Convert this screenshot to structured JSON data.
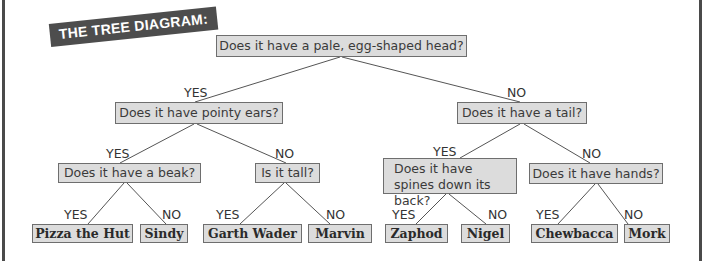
{
  "title": "THE TREE DIAGRAM:",
  "colors": {
    "box_fill": "#dcdcdc",
    "box_border": "#6e6e6e",
    "banner_bg": "#4d4d4d",
    "banner_text": "#ffffff",
    "line": "#555555",
    "frame": "#4a4a4a"
  },
  "tree": {
    "root": {
      "question": "Does it have a pale, egg-shaped head?",
      "yes_label": "YES",
      "no_label": "NO"
    },
    "level1": [
      {
        "question": "Does it have pointy ears?",
        "branch": "YES",
        "yes_label": "YES",
        "no_label": "NO"
      },
      {
        "question": "Does it have a tail?",
        "branch": "NO",
        "yes_label": "YES",
        "no_label": "NO"
      }
    ],
    "level2": [
      {
        "question": "Does it have a beak?",
        "branch": "YES",
        "yes_label": "YES",
        "no_label": "NO"
      },
      {
        "question": "Is it tall?",
        "branch": "NO",
        "yes_label": "YES",
        "no_label": "NO"
      },
      {
        "question": "Does it have spines down its back?",
        "branch": "YES",
        "yes_label": "YES",
        "no_label": "NO"
      },
      {
        "question": "Does it have hands?",
        "branch": "NO",
        "yes_label": "YES",
        "no_label": "NO"
      }
    ],
    "leaves": [
      {
        "name": "Pizza the Hut",
        "branch": "YES"
      },
      {
        "name": "Sindy",
        "branch": "NO"
      },
      {
        "name": "Garth Wader",
        "branch": "YES"
      },
      {
        "name": "Marvin",
        "branch": "NO"
      },
      {
        "name": "Zaphod",
        "branch": "YES"
      },
      {
        "name": "Nigel",
        "branch": "NO"
      },
      {
        "name": "Chewbacca",
        "branch": "YES"
      },
      {
        "name": "Mork",
        "branch": "NO"
      }
    ]
  }
}
